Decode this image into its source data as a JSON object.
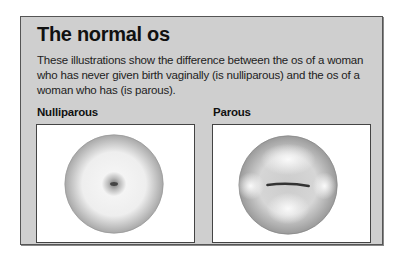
{
  "title": "The normal os",
  "description": "These illustrations show the difference between the os of a woman who has never given birth vaginally (is nulliparous) and the os of a woman who has (is parous).",
  "figures": [
    {
      "label": "Nulliparous",
      "icon": "nulliparous-os-illustration"
    },
    {
      "label": "Parous",
      "icon": "parous-os-illustration"
    }
  ],
  "colors": {
    "panel_background": "#cfcfcf",
    "border": "#555555"
  }
}
